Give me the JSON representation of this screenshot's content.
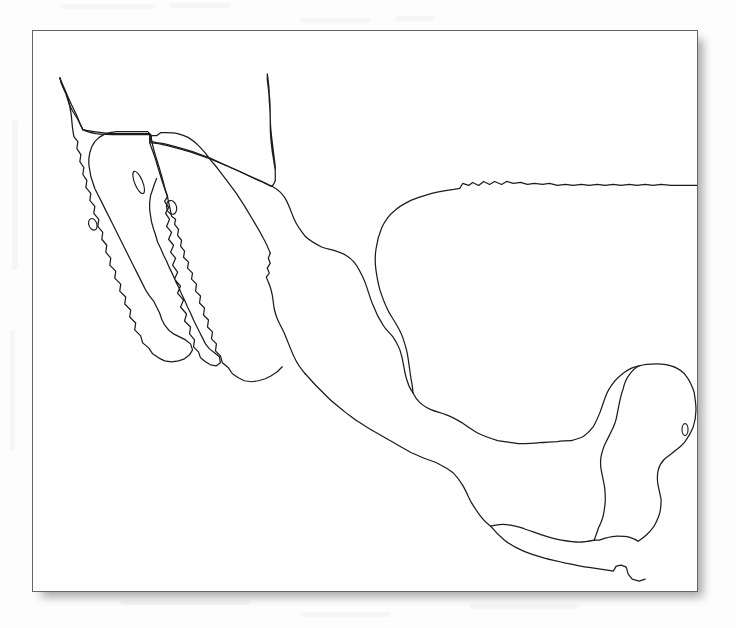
{
  "document": {
    "title": "Outline Map of Mexico",
    "subject": "Mexico",
    "map_type": "blank outline / coastline map",
    "caption": ""
  },
  "page": {
    "background_color": "#fdfdfd",
    "width": 736,
    "height": 628
  },
  "map_card": {
    "background_color": "#ffffff",
    "border_color": "#666666",
    "border_width": 1,
    "shadow": "soft drop shadow lower-right",
    "x": 32,
    "y": 30,
    "width": 666,
    "height": 562
  },
  "map": {
    "stroke_color": "#1c1c1c",
    "stroke_width": 1.25,
    "fill": "none",
    "projection_note": "unlabeled, no graticule, no place names",
    "features": [
      {
        "name": "mainland-mexico-outline",
        "type": "coastline-and-border",
        "description": "Continuous outline of mainland Mexico including the northern border with the United States, the Gulf of Mexico coast, the Yucatan Peninsula, the southern borders with Guatemala and Belize, and the Pacific coast."
      },
      {
        "name": "baja-california-peninsula",
        "type": "coastline",
        "description": "Long narrow peninsula in the northwest, separated from the mainland by the Gulf of California."
      },
      {
        "name": "isla-cedros",
        "type": "island",
        "description": "Small island off the Pacific side of the Baja peninsula."
      },
      {
        "name": "isla-angel-de-la-guarda",
        "type": "island",
        "description": "Elongated island in the upper Gulf of California."
      },
      {
        "name": "isla-tiburon",
        "type": "island",
        "description": "Small island in the Gulf of California near the Sonora coast."
      },
      {
        "name": "isla-cozumel",
        "type": "island",
        "description": "Small island off the eastern Yucatan coast."
      },
      {
        "name": "us-mexico-border",
        "type": "international-border",
        "description": "Northern boundary with the United States, showing the straight western segment, the El Paso step, and the Rio Grande."
      },
      {
        "name": "guatemala-belize-border",
        "type": "international-border",
        "description": "Southern boundary, including the rectangular Belize inlet on the Yucatan."
      }
    ],
    "labels": [],
    "legend": null,
    "scale_bar": null,
    "graticule": false
  }
}
